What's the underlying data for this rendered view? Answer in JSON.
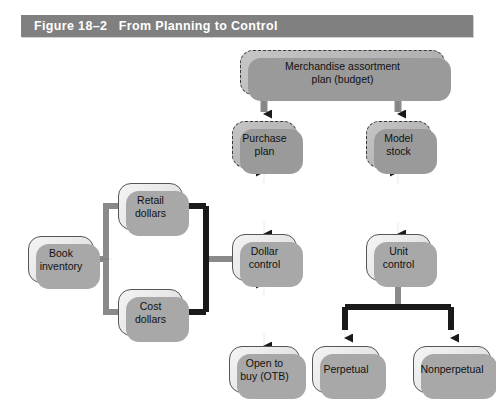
{
  "figure": {
    "number": "Figure 18–2",
    "title": "From Planning to Control",
    "banner_text": "Figure 18–2   From Planning to Control",
    "banner_color": "#808080",
    "banner_text_color": "#ffffff",
    "background_color": "#ffffff"
  },
  "legend": {
    "dashed_node_fill": "#b9b9b9",
    "dashed_node_border": "#3a3a3a",
    "solid_node_fill": "#e9e9e9",
    "solid_node_border": "#555555",
    "connector_color": "#1a1a1a",
    "shadow_color": "#a8a8a8"
  },
  "nodes": [
    {
      "id": "merchandise-assortment-plan",
      "label": "Merchandise assortment\nplan (budget)",
      "style": "dashed"
    },
    {
      "id": "purchase-plan",
      "label": "Purchase\nplan",
      "style": "dashed"
    },
    {
      "id": "model-stock",
      "label": "Model\nstock",
      "style": "dashed"
    },
    {
      "id": "dollar-control",
      "label": "Dollar\ncontrol",
      "style": "solid"
    },
    {
      "id": "unit-control",
      "label": "Unit\ncontrol",
      "style": "solid"
    },
    {
      "id": "retail-dollars",
      "label": "Retail\ndollars",
      "style": "solid"
    },
    {
      "id": "cost-dollars",
      "label": "Cost\ndollars",
      "style": "solid"
    },
    {
      "id": "book-inventory",
      "label": "Book\ninventory",
      "style": "solid"
    },
    {
      "id": "open-to-buy",
      "label": "Open to\nbuy (OTB)",
      "style": "solid"
    },
    {
      "id": "perpetual",
      "label": "Perpetual",
      "style": "solid"
    },
    {
      "id": "nonperpetual",
      "label": "Nonperpetual",
      "style": "solid"
    }
  ],
  "connections": [
    {
      "from": "merchandise-assortment-plan",
      "to": "purchase-plan",
      "arrow": "single"
    },
    {
      "from": "merchandise-assortment-plan",
      "to": "model-stock",
      "arrow": "single"
    },
    {
      "from": "purchase-plan",
      "to": "dollar-control",
      "arrow": "double"
    },
    {
      "from": "model-stock",
      "to": "unit-control",
      "arrow": "double"
    },
    {
      "from": "dollar-control",
      "to": "open-to-buy",
      "arrow": "double"
    },
    {
      "from": "dollar-control",
      "to": "retail-dollars",
      "arrow": "single"
    },
    {
      "from": "dollar-control",
      "to": "cost-dollars",
      "arrow": "single"
    },
    {
      "from": "retail-dollars",
      "to": "book-inventory",
      "arrow": "single"
    },
    {
      "from": "cost-dollars",
      "to": "book-inventory",
      "arrow": "single"
    },
    {
      "from": "unit-control",
      "to": "perpetual",
      "arrow": "single"
    },
    {
      "from": "unit-control",
      "to": "nonperpetual",
      "arrow": "single"
    }
  ]
}
